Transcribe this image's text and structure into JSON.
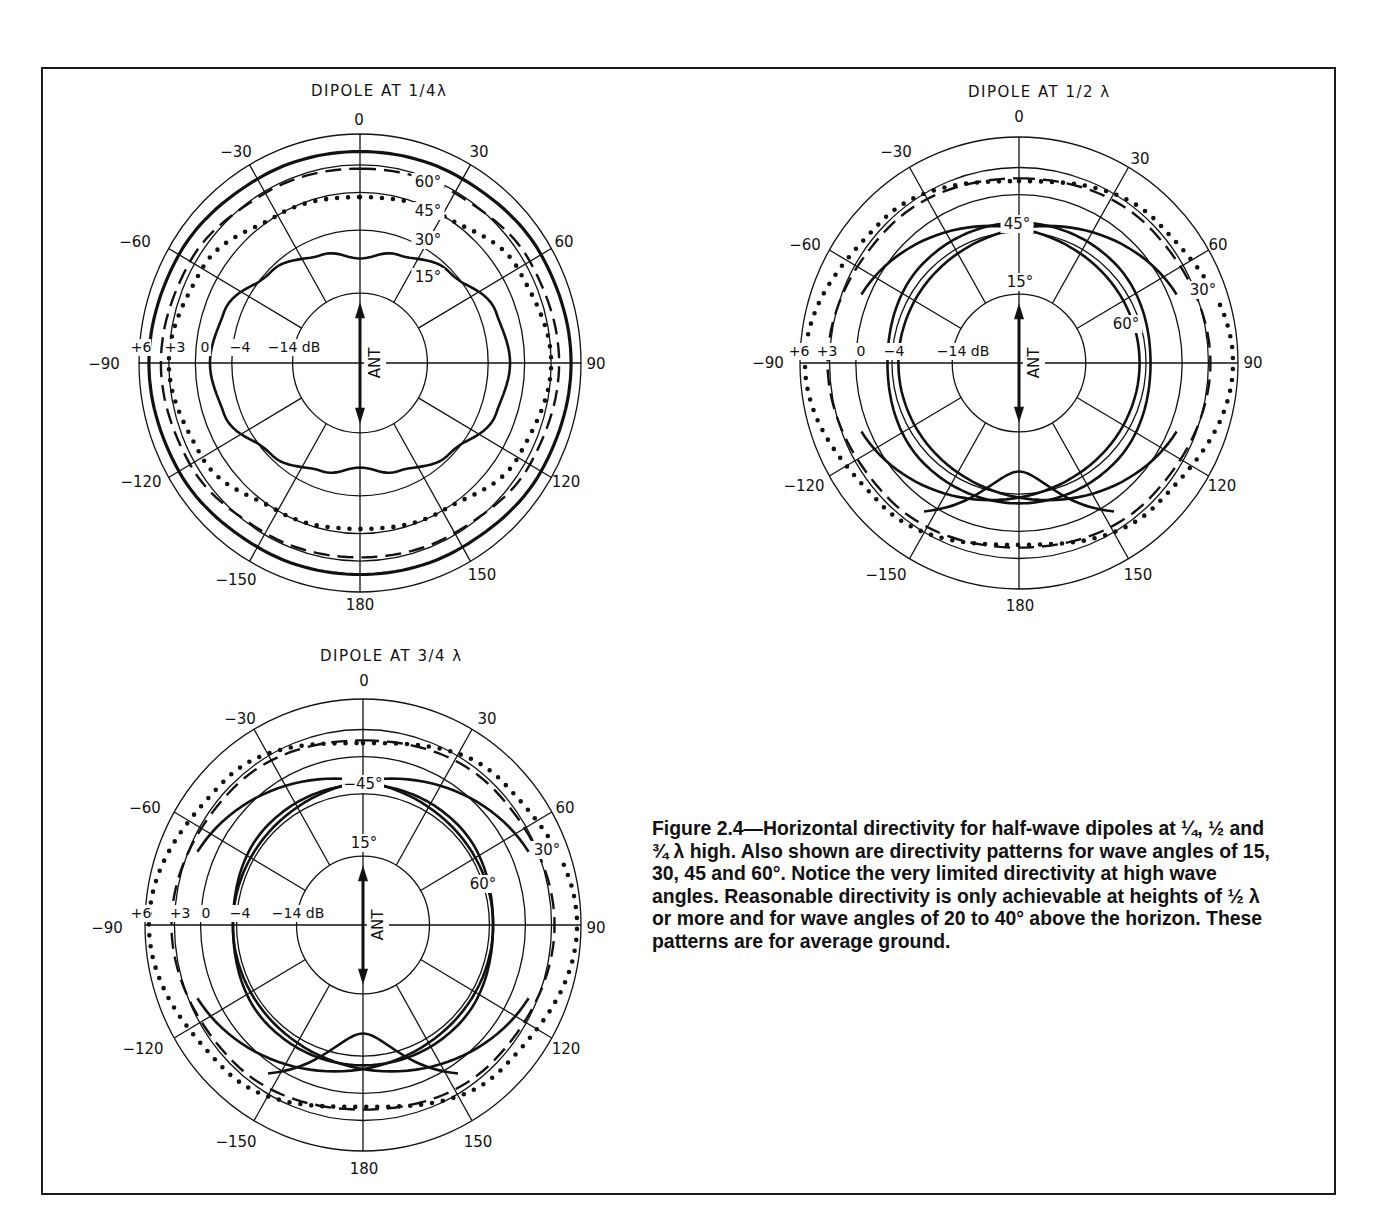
{
  "figure": {
    "caption": "Figure 2.4—Horizontal directivity for half-wave dipoles at ¼, ½ and ¾ λ high. Also shown are directivity patterns for wave angles of 15, 30, 45 and 60°. Notice the very limited directivity at high wave angles. Reasonable directivity is only achievable at heights of ½ λ or more and for wave angles of 20 to 40° above the horizon. These patterns are for average ground."
  },
  "chart_data": [
    {
      "type": "polar",
      "title": "DIPOLE AT 1/4λ",
      "center": [
        360,
        363
      ],
      "rx": 221,
      "ry": 229,
      "angle_ticks": [
        "0",
        "30",
        "60",
        "90",
        "120",
        "150",
        "180",
        "-150",
        "-120",
        "-90",
        "-60",
        "-30"
      ],
      "radial_ticks_db": [
        "+6",
        "+3",
        "0",
        "-4",
        "-14 dB"
      ],
      "radial_ring_fraction": [
        1.0,
        0.865,
        0.745,
        0.58,
        0.305
      ],
      "antenna_label": "ANT",
      "series": [
        {
          "name": "60°",
          "style": "solid-heavy",
          "db_at": {
            "0": 4.3,
            "30": 4.4,
            "60": 4.8,
            "90": 5.0,
            "120": 4.8,
            "150": 4.4,
            "180": 4.3
          }
        },
        {
          "name": "45°",
          "style": "dashed",
          "db_at": {
            "0": 2.6,
            "30": 2.8,
            "60": 3.5,
            "90": 3.8,
            "120": 3.5,
            "150": 2.8,
            "180": 2.6
          }
        },
        {
          "name": "30°",
          "style": "dotted",
          "db_at": {
            "0": -0.5,
            "30": 0.0,
            "60": 2.0,
            "90": 3.0,
            "120": 2.0,
            "150": 0.0,
            "180": -0.5
          }
        },
        {
          "name": "15°",
          "style": "solid",
          "db_at": {
            "0": -8.5,
            "20": -6.8,
            "45": -4.5,
            "70": -2.2,
            "90": -1.6,
            "110": -2.2,
            "135": -4.5,
            "160": -6.8,
            "180": -8.5
          }
        }
      ]
    },
    {
      "type": "polar",
      "title": "DIPOLE AT 1/2 λ",
      "center": [
        1019,
        363
      ],
      "rx": 219,
      "ry": 226,
      "angle_ticks": [
        "0",
        "30",
        "60",
        "90",
        "120",
        "150",
        "180",
        "-150",
        "-120",
        "-90",
        "-60",
        "-30"
      ],
      "radial_ticks_db": [
        "+6",
        "+3",
        "0",
        "-4",
        "-14 dB"
      ],
      "antenna_label": "ANT",
      "series": [
        {
          "name": "15°",
          "style": "solid",
          "note": "two lobes, broadside max about 0 dB, null toward ends"
        },
        {
          "name": "30°",
          "style": "dotted",
          "db_at": {
            "0": 1.5,
            "45": 3.5,
            "90": 5.5,
            "135": 3.5,
            "180": 1.5
          }
        },
        {
          "name": "45°",
          "style": "dashed",
          "db_at": {
            "0": 1.8,
            "45": 2.5,
            "90": 3.2,
            "135": 2.5,
            "180": 1.8
          }
        },
        {
          "name": "60°",
          "style": "solid",
          "db_at": {
            "0": -3.0,
            "45": -3.0,
            "90": -3.5,
            "135": -3.0,
            "180": -3.0
          }
        }
      ]
    },
    {
      "type": "polar",
      "title": "DIPOLE AT 3/4 λ",
      "center": [
        363,
        925
      ],
      "rx": 218,
      "ry": 226,
      "angle_ticks": [
        "0",
        "30",
        "60",
        "90",
        "120",
        "150",
        "180",
        "-150",
        "-120",
        "-90",
        "-60",
        "-30"
      ],
      "radial_ticks_db": [
        "+6",
        "+3",
        "0",
        "-4",
        "-14 dB"
      ],
      "antenna_label": "ANT",
      "series": [
        {
          "name": "15°",
          "style": "solid",
          "note": "two lobes, broadside max about 0 dB"
        },
        {
          "name": "30°",
          "style": "dotted",
          "db_at": {
            "0": 1.5,
            "45": 3.8,
            "90": 5.6,
            "135": 3.8,
            "180": 1.5
          }
        },
        {
          "name": "45°",
          "style": "dashed",
          "db_at": {
            "0": 1.8,
            "45": 2.6,
            "90": 3.3,
            "135": 2.6,
            "180": 1.8
          }
        },
        {
          "name": "60°",
          "style": "solid",
          "db_at": {
            "0": -3.0,
            "45": -3.0,
            "90": -3.6,
            "135": -3.0,
            "180": -3.0
          }
        }
      ]
    }
  ],
  "plots": [
    {
      "title": "DIPOLE AT 1/4λ",
      "tx": 311,
      "ty": 96,
      "angle_labels": [
        {
          "t": "0",
          "x": 359,
          "y": 125
        },
        {
          "t": "30",
          "x": 479,
          "y": 157
        },
        {
          "t": "60",
          "x": 564,
          "y": 247
        },
        {
          "t": "90",
          "x": 596,
          "y": 369
        },
        {
          "t": "120",
          "x": 566,
          "y": 487
        },
        {
          "t": "150",
          "x": 482,
          "y": 580
        },
        {
          "t": "180",
          "x": 360,
          "y": 610
        },
        {
          "t": "-150",
          "x": 236,
          "y": 585
        },
        {
          "t": "-120",
          "x": 141,
          "y": 487
        },
        {
          "t": "-90",
          "x": 104,
          "y": 369
        },
        {
          "t": "-60",
          "x": 135,
          "y": 247
        },
        {
          "t": "-30",
          "x": 236,
          "y": 157
        }
      ],
      "db_labels": [
        {
          "t": "+6",
          "x": 141,
          "y": 352
        },
        {
          "t": "+3",
          "x": 175,
          "y": 352
        },
        {
          "t": "0",
          "x": 205,
          "y": 352
        },
        {
          "t": "-4",
          "x": 240,
          "y": 352
        },
        {
          "t": "-14 dB",
          "x": 294,
          "y": 352
        }
      ],
      "curve_labels": [
        {
          "t": "60°",
          "x": 428,
          "y": 187
        },
        {
          "t": "45°",
          "x": 428,
          "y": 216
        },
        {
          "t": "30°",
          "x": 428,
          "y": 245
        },
        {
          "t": "15°",
          "x": 428,
          "y": 282
        }
      ],
      "ant": "ANT"
    },
    {
      "title": "DIPOLE AT 1/2 λ",
      "tx": 968,
      "ty": 97,
      "angle_labels": [
        {
          "t": "0",
          "x": 1019,
          "y": 122
        },
        {
          "t": "30",
          "x": 1140,
          "y": 164
        },
        {
          "t": "60",
          "x": 1218,
          "y": 250
        },
        {
          "t": "90",
          "x": 1253,
          "y": 368
        },
        {
          "t": "120",
          "x": 1222,
          "y": 491
        },
        {
          "t": "150",
          "x": 1138,
          "y": 580
        },
        {
          "t": "180",
          "x": 1020,
          "y": 611
        },
        {
          "t": "-150",
          "x": 886,
          "y": 580
        },
        {
          "t": "-120",
          "x": 804,
          "y": 491
        },
        {
          "t": "-90",
          "x": 768,
          "y": 368
        },
        {
          "t": "-60",
          "x": 805,
          "y": 250
        },
        {
          "t": "-30",
          "x": 896,
          "y": 157
        }
      ],
      "db_labels": [
        {
          "t": "+6",
          "x": 799,
          "y": 356
        },
        {
          "t": "+3",
          "x": 827,
          "y": 356
        },
        {
          "t": "0",
          "x": 861,
          "y": 356
        },
        {
          "t": "-4",
          "x": 894,
          "y": 356
        },
        {
          "t": "-14 dB",
          "x": 963,
          "y": 356
        }
      ],
      "curve_labels": [
        {
          "t": "45°",
          "x": 1017,
          "y": 229
        },
        {
          "t": "15°",
          "x": 1020,
          "y": 287
        },
        {
          "t": "30°",
          "x": 1203,
          "y": 295
        },
        {
          "t": "60°",
          "x": 1126,
          "y": 329
        }
      ],
      "ant": "ANT"
    },
    {
      "title": "DIPOLE AT 3/4 λ",
      "tx": 320,
      "ty": 661,
      "angle_labels": [
        {
          "t": "0",
          "x": 364,
          "y": 686
        },
        {
          "t": "30",
          "x": 487,
          "y": 724
        },
        {
          "t": "60",
          "x": 565,
          "y": 813
        },
        {
          "t": "90",
          "x": 596,
          "y": 933
        },
        {
          "t": "120",
          "x": 566,
          "y": 1054
        },
        {
          "t": "150",
          "x": 478,
          "y": 1147
        },
        {
          "t": "180",
          "x": 364,
          "y": 1174
        },
        {
          "t": "-150",
          "x": 236,
          "y": 1147
        },
        {
          "t": "-120",
          "x": 143,
          "y": 1054
        },
        {
          "t": "-90",
          "x": 107,
          "y": 933
        },
        {
          "t": "-60",
          "x": 145,
          "y": 813
        },
        {
          "t": "-30",
          "x": 240,
          "y": 724
        }
      ],
      "db_labels": [
        {
          "t": "+6",
          "x": 141,
          "y": 918
        },
        {
          "t": "+3",
          "x": 180,
          "y": 918
        },
        {
          "t": "0",
          "x": 206,
          "y": 918
        },
        {
          "t": "-4",
          "x": 240,
          "y": 918
        },
        {
          "t": "-14 dB",
          "x": 298,
          "y": 918
        }
      ],
      "curve_labels": [
        {
          "t": "-45°",
          "x": 363,
          "y": 789
        },
        {
          "t": "15°",
          "x": 364,
          "y": 848
        },
        {
          "t": "30°",
          "x": 547,
          "y": 855
        },
        {
          "t": "60°",
          "x": 483,
          "y": 889
        }
      ],
      "ant": "ANT"
    }
  ]
}
